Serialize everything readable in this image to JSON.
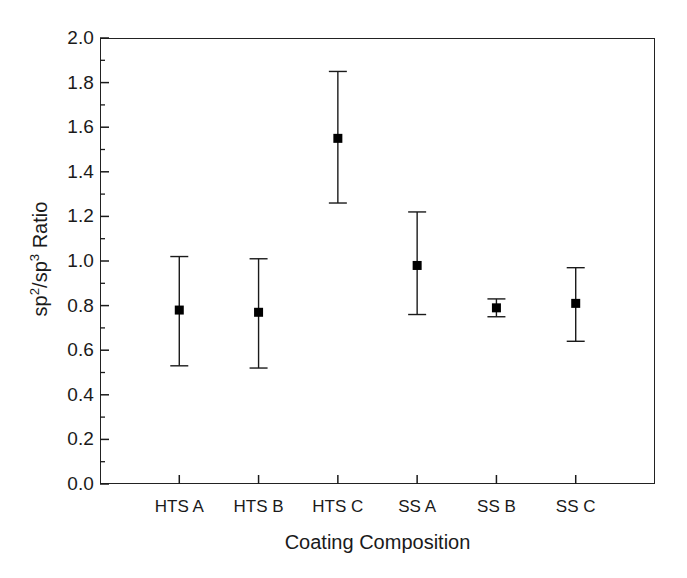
{
  "chart_data": {
    "type": "scatter",
    "title": "",
    "xlabel": "Coating Composition",
    "ylabel": "sp2/sp3 Ratio",
    "ylabel_parts": {
      "base1": "sp",
      "sup1": "2",
      "separator": "/sp",
      "sup2": "3",
      "tail": " Ratio"
    },
    "categories": [
      "HTS A",
      "HTS B",
      "HTS C",
      "SS A",
      "SS B",
      "SS C"
    ],
    "values": [
      0.78,
      0.77,
      1.55,
      0.98,
      0.79,
      0.81
    ],
    "err_upper": [
      1.02,
      1.01,
      1.85,
      1.22,
      0.83,
      0.97
    ],
    "err_lower": [
      0.53,
      0.52,
      1.26,
      0.76,
      0.75,
      0.64
    ],
    "ylim": [
      0.0,
      2.0
    ],
    "ytick_step": 0.2,
    "yminor_step": 0.1,
    "grid": false,
    "legend": "none",
    "marker": "square",
    "marker_color": "#000000",
    "line_color": "#1a1a1a",
    "ytick_labels": [
      "0.0",
      "0.2",
      "0.4",
      "0.6",
      "0.8",
      "1.0",
      "1.2",
      "1.4",
      "1.6",
      "1.8",
      "2.0"
    ],
    "ytick_values": [
      0.0,
      0.2,
      0.4,
      0.6,
      0.8,
      1.0,
      1.2,
      1.4,
      1.6,
      1.8,
      2.0
    ],
    "points": [
      {
        "category": "HTS A",
        "value": 0.78,
        "upper": 1.02,
        "lower": 0.53
      },
      {
        "category": "HTS B",
        "value": 0.77,
        "upper": 1.01,
        "lower": 0.52
      },
      {
        "category": "HTS C",
        "value": 1.55,
        "upper": 1.85,
        "lower": 1.26
      },
      {
        "category": "SS A",
        "value": 0.98,
        "upper": 1.22,
        "lower": 0.76
      },
      {
        "category": "SS B",
        "value": 0.79,
        "upper": 0.83,
        "lower": 0.75
      },
      {
        "category": "SS C",
        "value": 0.81,
        "upper": 0.97,
        "lower": 0.64
      }
    ]
  },
  "axes": {
    "x_title": "Coating Composition",
    "y_title_base": "sp",
    "y_title_sup_a": "2",
    "y_title_mid": "/sp",
    "y_title_sup_b": "3",
    "y_title_tail": " Ratio"
  }
}
